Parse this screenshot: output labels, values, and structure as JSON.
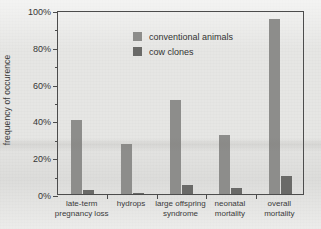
{
  "chart_data": {
    "type": "bar",
    "title": "",
    "xlabel": "",
    "ylabel": "frequency of occurence",
    "ylim": [
      0,
      100
    ],
    "ytick_labels": [
      "0%",
      "20%",
      "40%",
      "60%",
      "80%",
      "100%"
    ],
    "ytick_values": [
      0,
      20,
      40,
      60,
      80,
      100
    ],
    "yminor_values": [
      10,
      30,
      50,
      70,
      90
    ],
    "grid": false,
    "legend_position": "top-left inside plot",
    "unit": "%",
    "categories": [
      "late-term\npregnancy loss",
      "hydrops",
      "large offspring\nsyndrome",
      "neonatal\nmortality",
      "overall mortality"
    ],
    "series": [
      {
        "name": "conventional animals",
        "color": "#8d8d8b",
        "values": [
          40,
          27,
          51,
          32,
          95
        ]
      },
      {
        "name": "cow clones",
        "color": "#6a6a68",
        "values": [
          2,
          0.3,
          5,
          3,
          10
        ]
      }
    ]
  },
  "legend": {
    "items": [
      {
        "label": "conventional animals",
        "color": "#8d8d8b"
      },
      {
        "label": "cow clones",
        "color": "#6a6a68"
      }
    ]
  },
  "axis": {
    "y_title": "frequency of occurence"
  }
}
